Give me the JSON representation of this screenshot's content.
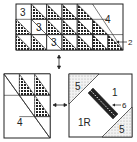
{
  "diagram": {
    "type": "quilt-block-assembly",
    "top_unit": {
      "rows": 3,
      "labels": {
        "triangle_square": "3",
        "large_triangle": "4",
        "pointer": "2"
      }
    },
    "bottom_left_unit": {
      "labels": {
        "large_triangle": "4"
      }
    },
    "bottom_right_unit": {
      "labels": {
        "corner_top": "5",
        "corner_bottom": "5",
        "upper_piece": "1",
        "lower_piece": "1R",
        "strip": "6"
      }
    },
    "arrows": [
      "vertical-double-arrow",
      "horizontal-double-arrow"
    ],
    "colors": {
      "line": "#222222",
      "dark_fabric": "#2a2a2a",
      "dotted_fabric": "#e4e4e4",
      "background": "#ffffff"
    }
  }
}
